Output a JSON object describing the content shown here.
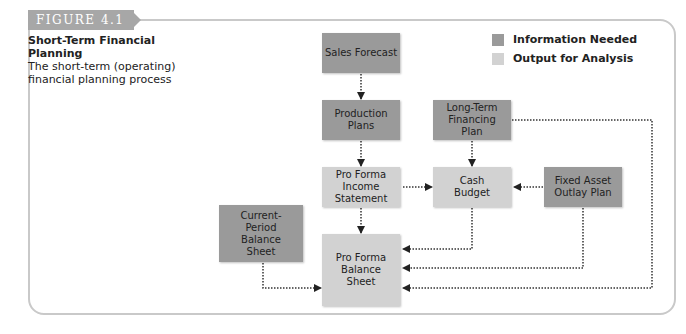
{
  "figure": {
    "tag": "FIGURE 4.1",
    "title": "Short-Term Financial Planning",
    "subtitle": "The short-term (operating) financial planning process"
  },
  "legend": [
    {
      "label": "Information Needed",
      "color": "#9a9a9a"
    },
    {
      "label": "Output for Analysis",
      "color": "#d2d2d2"
    }
  ],
  "nodes": {
    "sales_forecast": {
      "label": "Sales Forecast",
      "type": "Information Needed"
    },
    "production_plans": {
      "label": "Production Plans",
      "type": "Information Needed"
    },
    "long_term_financing_plan": {
      "label": "Long-Term Financing Plan",
      "type": "Information Needed"
    },
    "pro_forma_income_statement": {
      "label": "Pro Forma Income Statement",
      "type": "Output for Analysis"
    },
    "cash_budget": {
      "label": "Cash Budget",
      "type": "Output for Analysis"
    },
    "fixed_asset_outlay_plan": {
      "label": "Fixed Asset Outlay Plan",
      "type": "Information Needed"
    },
    "current_period_balance_sheet": {
      "label": "Current-Period Balance Sheet",
      "type": "Information Needed"
    },
    "pro_forma_balance_sheet": {
      "label": "Pro Forma Balance Sheet",
      "type": "Output for Analysis"
    }
  },
  "edges": [
    {
      "from": "Sales Forecast",
      "to": "Production Plans"
    },
    {
      "from": "Production Plans",
      "to": "Pro Forma Income Statement"
    },
    {
      "from": "Long-Term Financing Plan",
      "to": "Cash Budget"
    },
    {
      "from": "Pro Forma Income Statement",
      "to": "Cash Budget"
    },
    {
      "from": "Fixed Asset Outlay Plan",
      "to": "Cash Budget"
    },
    {
      "from": "Pro Forma Income Statement",
      "to": "Pro Forma Balance Sheet"
    },
    {
      "from": "Cash Budget",
      "to": "Pro Forma Balance Sheet"
    },
    {
      "from": "Fixed Asset Outlay Plan",
      "to": "Pro Forma Balance Sheet"
    },
    {
      "from": "Long-Term Financing Plan",
      "to": "Pro Forma Balance Sheet"
    },
    {
      "from": "Current-Period Balance Sheet",
      "to": "Pro Forma Balance Sheet"
    }
  ]
}
